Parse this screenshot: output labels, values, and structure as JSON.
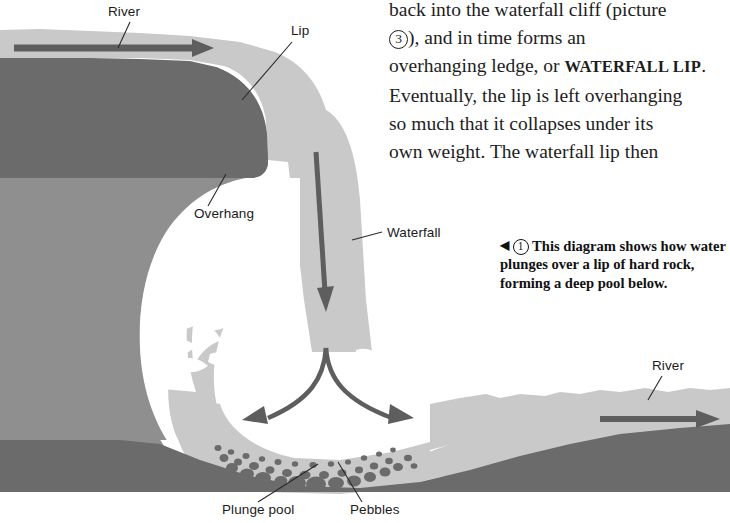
{
  "page": {
    "width": 730,
    "height": 523,
    "background": "#ffffff"
  },
  "colors": {
    "water": "#c9c9c9",
    "hard_rock": "#6b6b6b",
    "soft_rock": "#8f8f8f",
    "spray_white": "#ffffff",
    "arrow": "#5e5e5e",
    "pebble": "#6b6b6b",
    "text": "#1d1d1d",
    "leader_line": "#2a2a2a"
  },
  "body_text": {
    "lines": [
      "back into the waterfall cliff (picture",
      "), and in time forms an",
      "overhanging ledge, or ",
      "Eventually, the lip is left overhanging",
      "so much that it collapses under its",
      "own weight. The waterfall lip then"
    ],
    "line1": "back into the waterfall cliff (picture",
    "marker3": "3",
    "line2_after": "), and in time forms an",
    "line3_before": "overhanging ledge, or ",
    "small_caps_term": "WATERFALL LIP",
    "line3_after": ".",
    "line4": "Eventually, the lip is left overhanging",
    "line5": "so much that it collapses under its",
    "line6": "own weight. The waterfall lip then"
  },
  "caption": {
    "arrow_glyph": "◀",
    "figure_number": "1",
    "text": "This diagram shows how water plunges over a lip of hard rock, forming a deep pool below.",
    "line1": "This diagram shows how",
    "line2": "water plunges over a lip of hard",
    "line3": "rock, forming a deep pool below."
  },
  "diagram": {
    "labels": [
      {
        "id": "river-upstream",
        "text": "River",
        "x": 108,
        "y": 14
      },
      {
        "id": "lip",
        "text": "Lip",
        "x": 291,
        "y": 33
      },
      {
        "id": "overhang",
        "text": "Overhang",
        "x": 194,
        "y": 216
      },
      {
        "id": "waterfall",
        "text": "Waterfall",
        "x": 387,
        "y": 235
      },
      {
        "id": "river-downstream",
        "text": "River",
        "x": 652,
        "y": 368
      },
      {
        "id": "plunge-pool",
        "text": "Plunge pool",
        "x": 222,
        "y": 512
      },
      {
        "id": "pebbles",
        "text": "Pebbles",
        "x": 350,
        "y": 512
      }
    ],
    "flow_arrows": [
      {
        "id": "upstream-flow",
        "direction": "right"
      },
      {
        "id": "waterfall-descent",
        "direction": "down"
      },
      {
        "id": "pool-outflow-left",
        "direction": "up-left"
      },
      {
        "id": "pool-outflow-right",
        "direction": "up-right"
      },
      {
        "id": "downstream-flow",
        "direction": "right"
      }
    ],
    "features": [
      "hard rock cap layer",
      "soft rock beneath",
      "overhanging ledge cavity",
      "falling water curtain",
      "white spray at impact zone",
      "plunge pool with pebbles",
      "downstream river channel"
    ]
  }
}
